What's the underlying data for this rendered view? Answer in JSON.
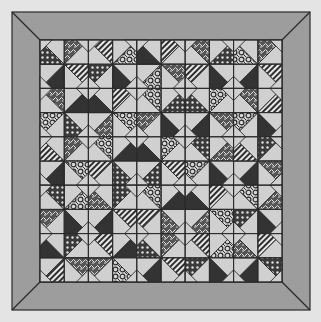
{
  "canvas": {
    "width": 321,
    "height": 322,
    "background": "#e4e4e4"
  },
  "quilt": {
    "outer": [
      12,
      12,
      310,
      310
    ],
    "inner": [
      40,
      40,
      282,
      282
    ],
    "border_color": "#9d9d9d",
    "line_color": "#2a2a2a",
    "light_fabric": "#d0d0d0",
    "dark_fabric": "#333333",
    "blocks_per_side": 5,
    "fabrics": [
      "dark",
      "stripe",
      "floral",
      "dots",
      "lace"
    ],
    "blocks": [
      [
        [
          4,
          1,
          0,
          3
        ],
        [
          2,
          0,
          3,
          1
        ],
        [
          1,
          4,
          2,
          0
        ],
        [
          3,
          0,
          1,
          4
        ],
        [
          4,
          1,
          0,
          2
        ]
      ],
      [
        [
          0,
          3,
          2,
          4
        ],
        [
          1,
          2,
          4,
          0
        ],
        [
          3,
          0,
          4,
          2
        ],
        [
          2,
          4,
          0,
          3
        ],
        [
          1,
          0,
          2,
          4
        ]
      ],
      [
        [
          4,
          2,
          0,
          1
        ],
        [
          0,
          3,
          1,
          2
        ],
        [
          2,
          1,
          3,
          0
        ],
        [
          4,
          0,
          2,
          3
        ],
        [
          3,
          4,
          0,
          1
        ]
      ],
      [
        [
          2,
          0,
          4,
          3
        ],
        [
          3,
          1,
          0,
          4
        ],
        [
          0,
          4,
          1,
          2
        ],
        [
          1,
          2,
          4,
          0
        ],
        [
          4,
          0,
          3,
          2
        ]
      ],
      [
        [
          3,
          4,
          1,
          0
        ],
        [
          0,
          2,
          4,
          1
        ],
        [
          4,
          1,
          0,
          3
        ],
        [
          2,
          0,
          3,
          1
        ],
        [
          1,
          3,
          0,
          4
        ]
      ]
    ]
  }
}
